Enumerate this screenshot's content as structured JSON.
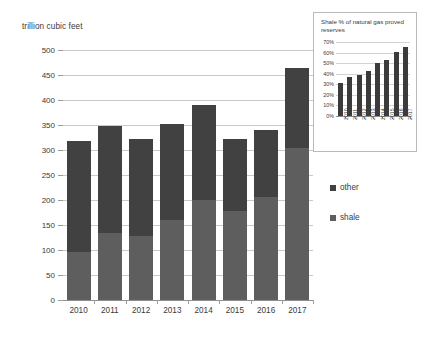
{
  "chart_data": [
    {
      "id": "main",
      "type": "bar",
      "stacked": true,
      "title": "",
      "xlabel": "",
      "ylabel": "trillion cubic feet",
      "ylim": [
        0,
        500
      ],
      "ytick_step": 50,
      "yticks": [
        "500",
        "450",
        "400",
        "350",
        "300",
        "250",
        "200",
        "150",
        "100",
        "50",
        "0"
      ],
      "grid": true,
      "legend_position": "right",
      "categories": [
        "2010",
        "2011",
        "2012",
        "2013",
        "2014",
        "2015",
        "2016",
        "2017"
      ],
      "series": [
        {
          "name": "shale",
          "color": "#5e5e5e",
          "values": [
            97,
            135,
            129,
            160,
            200,
            178,
            207,
            305
          ]
        },
        {
          "name": "other",
          "color": "#414141",
          "values": [
            221,
            214,
            194,
            193,
            190,
            145,
            134,
            160
          ]
        }
      ],
      "totals": [
        318,
        349,
        323,
        353,
        390,
        323,
        341,
        465
      ]
    },
    {
      "id": "inset",
      "type": "bar",
      "title": "Shale % of natural gas proved reserves",
      "xlabel": "",
      "ylabel": "",
      "ylim": [
        0,
        70
      ],
      "ytick_step": 10,
      "yticks": [
        "70%",
        "60%",
        "50%",
        "40%",
        "30%",
        "20%",
        "10%",
        "0%"
      ],
      "grid": true,
      "categories": [
        "2010",
        "2011",
        "2012",
        "2013",
        "2014",
        "2015",
        "2016",
        "2017"
      ],
      "values": [
        31,
        37,
        39,
        43,
        50,
        53,
        61,
        65
      ],
      "bar_color": "#3b3b3b"
    }
  ],
  "main": {
    "axis_title": "trillion cubic feet"
  },
  "legend": {
    "items": [
      {
        "label": "other",
        "color": "#414141"
      },
      {
        "label": "shale",
        "color": "#5e5e5e"
      }
    ]
  },
  "inset": {
    "title": "Shale % of natural gas proved reserves"
  }
}
